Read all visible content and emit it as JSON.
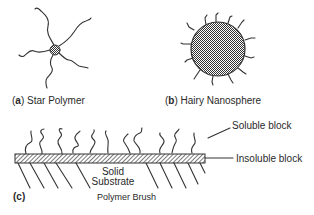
{
  "panels": {
    "a": {
      "letter": "a",
      "title": "Star Polymer"
    },
    "b": {
      "letter": "b",
      "title": "Hairy Nanosphere"
    },
    "c": {
      "letter": "(c)",
      "title": "Polymer Brush"
    }
  },
  "annotations": {
    "soluble_block": "Soluble block",
    "insoluble_block": "Insoluble block",
    "substrate_line1": "Solid",
    "substrate_line2": "Substrate"
  },
  "colors": {
    "stroke": "#333333",
    "background": "#ffffff"
  }
}
